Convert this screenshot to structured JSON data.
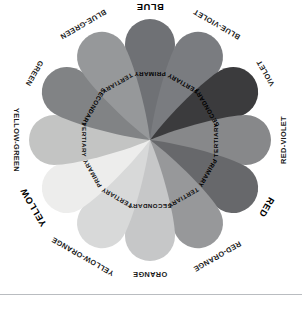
{
  "diagram": {
    "center": {
      "x": 150,
      "y": 140
    },
    "background_color": "#ffffff",
    "divider": {
      "y": 294,
      "color": "#b9bcc0"
    },
    "petals": [
      {
        "hue_label": "BLUE",
        "role_label": "PRIMARY",
        "role": "primary",
        "angle_deg": 0,
        "fill": "#6f7175",
        "label_on_dark": true,
        "hue_label_emphasis": "bold-large"
      },
      {
        "hue_label": "BLUE-VIOLET",
        "role_label": "TERTIARY",
        "role": "tertiary",
        "angle_deg": 30,
        "fill": "#7a7c80",
        "label_on_dark": true,
        "hue_label_emphasis": "normal"
      },
      {
        "hue_label": "VIOLET",
        "role_label": "SECONDARY",
        "role": "secondary",
        "angle_deg": 60,
        "fill": "#3b3b3d",
        "label_on_dark": true,
        "hue_label_emphasis": "normal"
      },
      {
        "hue_label": "RED-VIOLET",
        "role_label": "TERTIARY",
        "role": "tertiary",
        "angle_deg": 90,
        "fill": "#87888a",
        "label_on_dark": true,
        "hue_label_emphasis": "normal"
      },
      {
        "hue_label": "RED",
        "role_label": "PRIMARY",
        "role": "primary",
        "angle_deg": 120,
        "fill": "#67686b",
        "label_on_dark": true,
        "hue_label_emphasis": "bold-large"
      },
      {
        "hue_label": "RED-ORANGE",
        "role_label": "TERTIARY",
        "role": "tertiary",
        "angle_deg": 150,
        "fill": "#97989a",
        "label_on_dark": false,
        "hue_label_emphasis": "normal"
      },
      {
        "hue_label": "ORANGE",
        "role_label": "SECONDARY",
        "role": "secondary",
        "angle_deg": 180,
        "fill": "#c6c7c8",
        "label_on_dark": false,
        "hue_label_emphasis": "normal"
      },
      {
        "hue_label": "YELLOW-ORANGE",
        "role_label": "TERTIARY",
        "role": "tertiary",
        "angle_deg": 210,
        "fill": "#d8d9d9",
        "label_on_dark": false,
        "hue_label_emphasis": "normal"
      },
      {
        "hue_label": "YELLOW",
        "role_label": "PRIMARY",
        "role": "primary",
        "angle_deg": 240,
        "fill": "#ededec",
        "label_on_dark": false,
        "hue_label_emphasis": "bold-large"
      },
      {
        "hue_label": "YELLOW-GREEN",
        "role_label": "TERTIARY",
        "role": "tertiary",
        "angle_deg": 270,
        "fill": "#c3c4c3",
        "label_on_dark": false,
        "hue_label_emphasis": "normal"
      },
      {
        "hue_label": "GREEN",
        "role_label": "SECONDARY",
        "role": "secondary",
        "angle_deg": 300,
        "fill": "#818385",
        "label_on_dark": true,
        "hue_label_emphasis": "normal"
      },
      {
        "hue_label": "BLUE-GREEN",
        "role_label": "TERTIARY",
        "role": "tertiary",
        "angle_deg": 330,
        "fill": "#96989a",
        "label_on_dark": false,
        "hue_label_emphasis": "normal"
      }
    ]
  }
}
